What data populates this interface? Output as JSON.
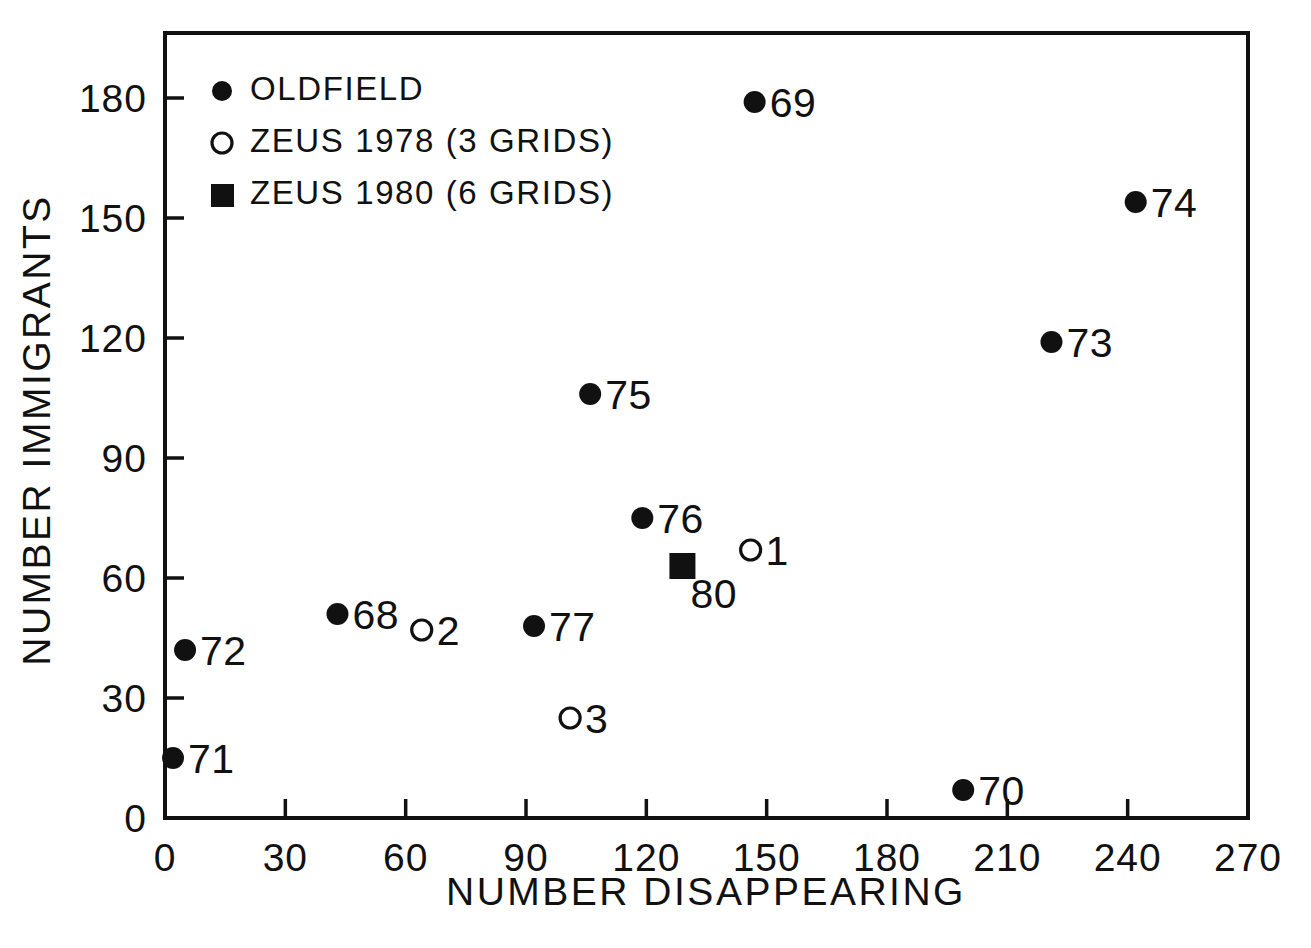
{
  "chart_data": {
    "type": "scatter",
    "title": "",
    "xlabel": "NUMBER DISAPPEARING",
    "ylabel": "NUMBER IMMIGRANTS",
    "xlim": [
      0,
      270
    ],
    "ylim": [
      0,
      190
    ],
    "grid": false,
    "xticks": [
      0,
      30,
      60,
      90,
      120,
      150,
      180,
      210,
      240,
      270
    ],
    "yticks": [
      0,
      30,
      60,
      90,
      120,
      150,
      180
    ],
    "xticklabels": [
      "0",
      "30",
      "60",
      "90",
      "120",
      "150",
      "180",
      "210",
      "240",
      "270"
    ],
    "yticklabels": [
      "0",
      "30",
      "60",
      "90",
      "120",
      "150",
      "180"
    ],
    "legend_position": "upper-left",
    "series": [
      {
        "name": "OLDFIELD",
        "marker": "filled-circle",
        "color": "#111111",
        "points": [
          {
            "label": "69",
            "x": 147,
            "y": 179,
            "label_side": "right"
          },
          {
            "label": "74",
            "x": 242,
            "y": 154,
            "label_side": "right"
          },
          {
            "label": "73",
            "x": 221,
            "y": 119,
            "label_side": "right"
          },
          {
            "label": "75",
            "x": 106,
            "y": 106,
            "label_side": "right"
          },
          {
            "label": "76",
            "x": 119,
            "y": 75,
            "label_side": "right"
          },
          {
            "label": "68",
            "x": 43,
            "y": 51,
            "label_side": "right"
          },
          {
            "label": "77",
            "x": 92,
            "y": 48,
            "label_side": "right"
          },
          {
            "label": "72",
            "x": 5,
            "y": 42,
            "label_side": "right"
          },
          {
            "label": "71",
            "x": 2,
            "y": 15,
            "label_side": "right"
          },
          {
            "label": "70",
            "x": 199,
            "y": 7,
            "label_side": "right"
          }
        ]
      },
      {
        "name": "ZEUS 1978 (3 GRIDS)",
        "marker": "open-circle",
        "color": "#111111",
        "points": [
          {
            "label": "1",
            "x": 146,
            "y": 67,
            "label_side": "right"
          },
          {
            "label": "2",
            "x": 64,
            "y": 47,
            "label_side": "right"
          },
          {
            "label": "3",
            "x": 101,
            "y": 25,
            "label_side": "right"
          }
        ]
      },
      {
        "name": "ZEUS 1980 (6 GRIDS)",
        "marker": "filled-square",
        "color": "#111111",
        "points": [
          {
            "label": "80",
            "x": 129,
            "y": 63,
            "label_side": "below-right"
          }
        ]
      }
    ]
  },
  "legend": {
    "entries": [
      {
        "marker": "filled-circle",
        "label": "OLDFIELD"
      },
      {
        "marker": "open-circle",
        "label": "ZEUS 1978 (3 GRIDS)"
      },
      {
        "marker": "filled-square",
        "label": "ZEUS 1980 (6 GRIDS)"
      }
    ]
  },
  "axes": {
    "x_title": "NUMBER DISAPPEARING",
    "y_title": "NUMBER IMMIGRANTS"
  }
}
